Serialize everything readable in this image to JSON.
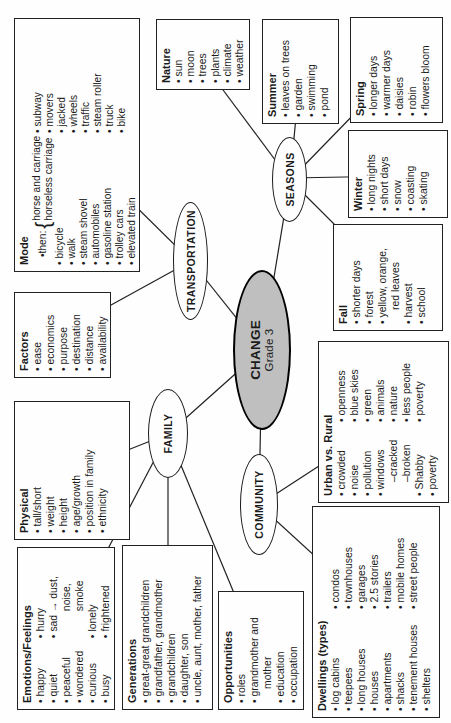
{
  "colors": {
    "ink": "#1b1b1b",
    "center_fill": "#bfbfbf",
    "paper": "#fefefe"
  },
  "center": {
    "title": "CHANGE",
    "subtitle": "Grade 3"
  },
  "nodes": {
    "transportation": "TRANSPORTATION",
    "seasons": "SEASONS",
    "family": "FAMILY",
    "community": "COMMUNITY"
  },
  "boxes": {
    "mode": {
      "title": "Mode",
      "then_label": "then:",
      "brace": "{",
      "then_options": [
        "horse and carriage",
        "horseless carriage"
      ],
      "col1": [
        "bicycle",
        "walk",
        "steam shovel",
        "automobiles",
        "gasoline station",
        "trolley cars",
        "elevated train"
      ],
      "col2": [
        "subway",
        "movers",
        "jacked",
        "wheels",
        "traffic",
        "steam roller",
        "truck",
        "bike"
      ]
    },
    "factors": {
      "title": "Factors",
      "items": [
        "ease",
        "economics",
        "purpose",
        "destination",
        "distance",
        "availability"
      ]
    },
    "physical": {
      "title": "Physical",
      "items": [
        "tall/short",
        "weight",
        "height",
        "age/growth",
        "position in family",
        "ethnicity"
      ]
    },
    "nature": {
      "title": "Nature",
      "items": [
        "sun",
        "moon",
        "trees",
        "plants",
        "climate",
        "weather"
      ]
    },
    "summer": {
      "title": "Summer",
      "items": [
        "leaves on trees",
        "garden",
        "swimming",
        "pond"
      ]
    },
    "spring": {
      "title": "Spring",
      "items": [
        "longer days",
        "warmer days",
        "daisies",
        "robin",
        "flowers bloom"
      ]
    },
    "winter": {
      "title": "Winter",
      "items": [
        "long nights",
        "short days",
        "snow",
        "coasting",
        "skating"
      ]
    },
    "fall": {
      "title": "Fall",
      "items": [
        "shorter days",
        "forest",
        "yellow, orange,",
        "red leaves",
        "harvest",
        "school"
      ]
    },
    "urban": {
      "title": "Urban vs. Rural",
      "col1": [
        "crowded",
        "noise",
        "pollution",
        "windows",
        "–cracked",
        "–broken",
        "Shabby",
        "poverty"
      ],
      "col2": [
        "openness",
        "blue skies",
        "green",
        "animals",
        "nature",
        "less people",
        "poverty"
      ]
    },
    "emotions": {
      "title": "Emotions/Feelings",
      "col1": [
        "happy",
        "quiet",
        "peaceful",
        "wondered",
        "curious",
        "busy"
      ],
      "col2": [
        "hurry",
        "sad → dust,",
        "noise, smoke",
        "lonely",
        "frightened"
      ]
    },
    "generations": {
      "title": "Generations",
      "items": [
        "great-great grandchildren",
        "grandfather, grandmother",
        "grandchildren",
        "daughter, son",
        "uncle, aunt, mother, father"
      ]
    },
    "opportunities": {
      "title": "Opportunities",
      "items": [
        "roles",
        "grandmother and",
        "mother",
        "education",
        "occupation"
      ]
    },
    "dwellings": {
      "title": "Dwellings (types)",
      "col1": [
        "log cabins",
        "teepees",
        "long houses",
        "houses",
        "apartments",
        "shacks",
        "tenement houses",
        "shelters"
      ],
      "col2": [
        "condos",
        "townhouses",
        "garages",
        "2.5 stories",
        "trailers",
        "mobile homes",
        "street people"
      ]
    }
  }
}
